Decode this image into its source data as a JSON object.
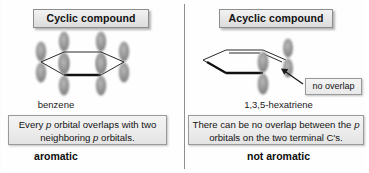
{
  "panels": {
    "left": {
      "header_label": "Cyclic compound",
      "molecule_name": "benzene",
      "explanation_part1": "Every ",
      "explanation_italic1": "p",
      "explanation_part2": " orbital overlaps with two neighboring ",
      "explanation_italic2": "p",
      "explanation_part3": " orbitals.",
      "explanation_full": "Every p orbital overlaps with two neighboring p orbitals.",
      "verdict": "aromatic",
      "structure": {
        "type": "benzene-ring-with-p-orbitals",
        "ring_vertices": 6,
        "p_orbital_count": 6,
        "bold_front_bond": true
      }
    },
    "right": {
      "header_label": "Acyclic compound",
      "molecule_name": "1,3,5-hexatriene",
      "explanation_part1": "There can be no overlap between the ",
      "explanation_italic1": "p",
      "explanation_part2": " orbitals on the two terminal C's.",
      "explanation_full": "There can be no overlap between the p orbitals on the two terminal C's.",
      "verdict": "not aromatic",
      "callout_label": "no overlap",
      "structure": {
        "type": "hexatriene-chain-with-terminal-p-orbitals",
        "chain_carbons": 6,
        "p_orbital_count": 2,
        "bold_front_bond": true,
        "gap_between_terminal_carbons": true
      }
    }
  },
  "colors": {
    "background": "#fefefe",
    "box_fill": "#ececec",
    "box_border": "#8c8c8c",
    "divider": "#8e8e8e",
    "orbital_gray": "#8a8a8a",
    "bond_line": "#2a2a2a",
    "text": "#111111"
  },
  "icons": {
    "divider": "vertical-divider",
    "arrow": "callout-arrow-icon",
    "orbital": "p-orbital-icon"
  }
}
